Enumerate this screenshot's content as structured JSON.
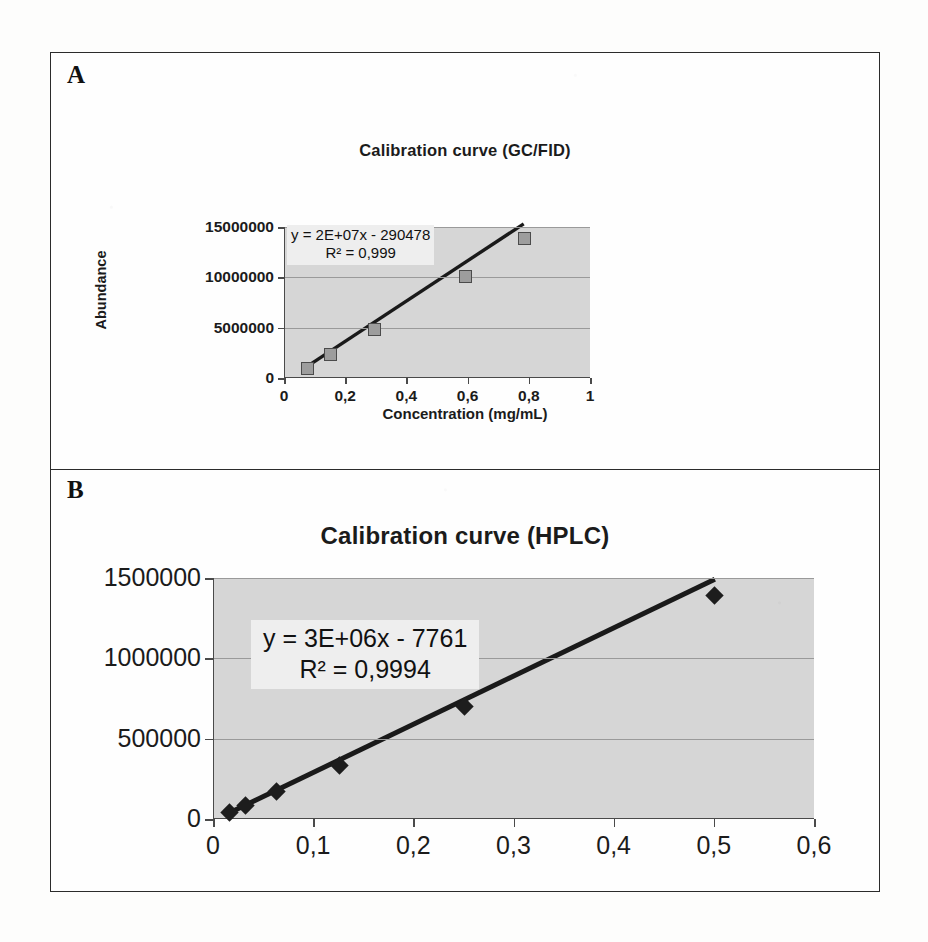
{
  "figure": {
    "panels": [
      {
        "letter": "A"
      },
      {
        "letter": "B"
      }
    ]
  },
  "chart_data": [
    {
      "panel": "A",
      "type": "scatter",
      "title": "Calibration curve (GC/FID)",
      "xlabel": "Concentration (mg/mL)",
      "ylabel": "Abundance",
      "xlim": [
        0,
        1
      ],
      "ylim": [
        0,
        15000000
      ],
      "grid": true,
      "legend": "none",
      "xticks": [
        "0",
        "0,2",
        "0,4",
        "0,6",
        "0,8",
        "1"
      ],
      "xtick_values": [
        0,
        0.2,
        0.4,
        0.6,
        0.8,
        1
      ],
      "yticks": [
        "0",
        "5000000",
        "10000000",
        "15000000"
      ],
      "ytick_values": [
        0,
        5000000,
        10000000,
        15000000
      ],
      "marker": "square",
      "x": [
        0.07,
        0.145,
        0.29,
        0.585,
        0.78
      ],
      "y": [
        1000000,
        2400000,
        4900000,
        10200000,
        14000000
      ],
      "annotations": {
        "equation": "y = 2E+07x - 290478",
        "r_squared": "R² = 0,999"
      },
      "fit": {
        "slope": 20000000,
        "intercept": -290478,
        "r2": 0.999
      }
    },
    {
      "panel": "B",
      "type": "scatter",
      "title": "Calibration curve (HPLC)",
      "xlabel": "",
      "ylabel": "",
      "xlim": [
        0,
        0.6
      ],
      "ylim": [
        0,
        1500000
      ],
      "grid": true,
      "legend": "none",
      "xticks": [
        "0",
        "0,1",
        "0,2",
        "0,3",
        "0,4",
        "0,5",
        "0,6"
      ],
      "xtick_values": [
        0,
        0.1,
        0.2,
        0.3,
        0.4,
        0.5,
        0.6
      ],
      "yticks": [
        "0",
        "500000",
        "1000000",
        "1500000"
      ],
      "ytick_values": [
        0,
        500000,
        1000000,
        1500000
      ],
      "marker": "diamond",
      "x": [
        0.0156,
        0.031,
        0.0625,
        0.125,
        0.25,
        0.5
      ],
      "y": [
        40000,
        85000,
        170000,
        330000,
        700000,
        1390000
      ],
      "annotations": {
        "equation": "y = 3E+06x - 7761",
        "r_squared": "R² = 0,9994"
      },
      "fit": {
        "slope": 3000000,
        "intercept": -7761,
        "r2": 0.9994
      }
    }
  ],
  "colors": {
    "plot_background": "#d6d6d6",
    "axis": "#4a4a4a",
    "gridline": "#9a9a9a",
    "marker_a_fill": "#9d9d9d",
    "marker_a_border": "#4b4b4b",
    "marker_b_fill": "#1d1d1d",
    "trendline": "#1a1a1a",
    "frame": "#2b2b2b",
    "equation_box": "#eeeeee"
  }
}
